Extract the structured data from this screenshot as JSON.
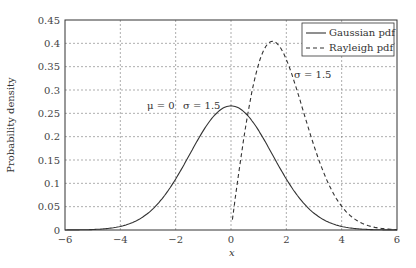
{
  "chart_data": {
    "type": "line",
    "title": "",
    "xlabel": "x",
    "ylabel": "Probability density",
    "xlim": [
      -6,
      6
    ],
    "ylim": [
      0,
      0.45
    ],
    "xticks": [
      "-6",
      "-4",
      "-2",
      "0",
      "2",
      "4",
      "6"
    ],
    "yticks": [
      "0",
      "0.05",
      "0.1",
      "0.15",
      "0.2",
      "0.25",
      "0.3",
      "0.35",
      "0.4",
      "0.45"
    ],
    "grid": true,
    "legend_position": "upper right",
    "series": [
      {
        "name": "Gaussian pdf",
        "style": "solid",
        "mu": 0,
        "sigma": 1.5,
        "peak": 0.266
      },
      {
        "name": "Rayleigh pdf",
        "style": "dashed",
        "sigma": 1.5,
        "peak": 0.404,
        "peak_x": 1.5
      }
    ],
    "annotations": [
      {
        "text": "μ = 0",
        "x": -2.3,
        "y": 0.27
      },
      {
        "text": "σ = 1.5",
        "x": -0.5,
        "y": 0.27
      },
      {
        "text": "σ = 1.5",
        "x": 2.7,
        "y": 0.32
      }
    ]
  },
  "legend": {
    "items": [
      "Gaussian pdf",
      "Rayleigh pdf"
    ]
  },
  "axes": {
    "xlabel": "x",
    "ylabel": "Probability density"
  }
}
